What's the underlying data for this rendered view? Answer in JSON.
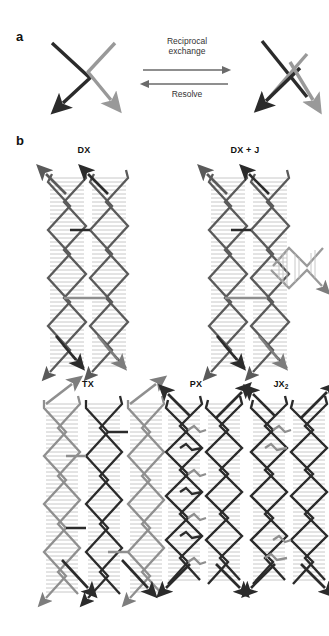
{
  "figure": {
    "background": "#ffffff",
    "width": 329,
    "height": 636,
    "colors": {
      "dark_strand": "#2b2b2b",
      "light_strand": "#999999",
      "mid_strand": "#606060",
      "basepair_rung": "#bdbdbd",
      "arrow_text": "#333333"
    }
  },
  "panel_a": {
    "letter": "a",
    "reaction": {
      "forward_label": "Reciprocal\nexchange",
      "reverse_label": "Resolve"
    },
    "left_state": {
      "name": "unexchanged-strands",
      "strands": [
        {
          "name": "dark-strand",
          "color": "#2b2b2b",
          "arrow": "down-left"
        },
        {
          "name": "light-strand",
          "color": "#999999",
          "arrow": "down-right"
        }
      ]
    },
    "right_state": {
      "name": "crossed-strands",
      "strands": [
        {
          "name": "dark-strand",
          "color": "#2b2b2b",
          "arrow": "down-left"
        },
        {
          "name": "light-strand",
          "color": "#999999",
          "arrow": "down-right"
        }
      ]
    }
  },
  "panel_b": {
    "letter": "b",
    "motifs": [
      {
        "id": "dx",
        "label": "DX",
        "helices": 2,
        "crossovers": 2,
        "has_branch": false,
        "label_x": 84,
        "label_y": 146
      },
      {
        "id": "dx-j",
        "label": "DX + J",
        "helices": 2,
        "crossovers": 2,
        "has_branch": true,
        "branch_direction": "right",
        "label_x": 245,
        "label_y": 146
      },
      {
        "id": "tx",
        "label": "TX",
        "helices": 3,
        "crossovers": 4,
        "has_branch": false,
        "label_x": 88,
        "label_y": 380
      },
      {
        "id": "px",
        "label": "PX",
        "helices": 2,
        "crossovers": 6,
        "has_branch": false,
        "label_x": 196,
        "label_y": 380
      },
      {
        "id": "jx2",
        "label": "JX",
        "label_subscript": "2",
        "helices": 2,
        "crossovers": 4,
        "has_branch": false,
        "label_x": 281,
        "label_y": 380
      }
    ]
  }
}
